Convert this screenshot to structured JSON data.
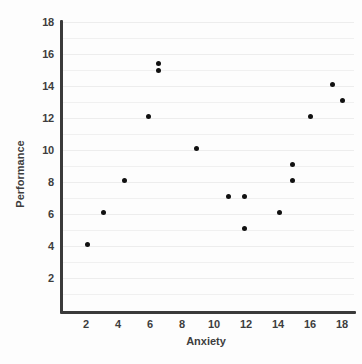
{
  "chart_data": {
    "type": "scatter",
    "title": "",
    "xlabel": "Anxiety",
    "ylabel": "Performance",
    "xlim": [
      0,
      19
    ],
    "ylim": [
      0,
      18
    ],
    "grid": true,
    "legend": null,
    "x_ticks": [
      2,
      4,
      6,
      8,
      10,
      12,
      14,
      16,
      18
    ],
    "y_ticks": [
      2,
      4,
      6,
      8,
      10,
      12,
      14,
      16,
      18
    ],
    "x_tick_labels": [
      "2",
      "4",
      "6",
      "8",
      "10",
      "12",
      "14",
      "16",
      "18"
    ],
    "y_tick_labels": [
      "2",
      "4",
      "6",
      "8",
      "10",
      "12",
      "14",
      "16",
      "18"
    ],
    "point_color": "#111111",
    "gridline_color": "#f0f0f0",
    "axis_color": "#3a3a3a",
    "series": [
      {
        "name": "observations",
        "points": [
          {
            "x": 2.1,
            "y": 4.1
          },
          {
            "x": 3.1,
            "y": 6.1
          },
          {
            "x": 4.4,
            "y": 8.1
          },
          {
            "x": 5.9,
            "y": 12.1
          },
          {
            "x": 6.5,
            "y": 15.4
          },
          {
            "x": 6.5,
            "y": 15.0
          },
          {
            "x": 8.9,
            "y": 10.1
          },
          {
            "x": 10.9,
            "y": 7.1
          },
          {
            "x": 11.9,
            "y": 7.1
          },
          {
            "x": 11.9,
            "y": 5.1
          },
          {
            "x": 14.1,
            "y": 6.1
          },
          {
            "x": 14.9,
            "y": 9.1
          },
          {
            "x": 14.9,
            "y": 8.1
          },
          {
            "x": 16.0,
            "y": 12.1
          },
          {
            "x": 17.4,
            "y": 14.1
          },
          {
            "x": 18.0,
            "y": 13.1
          }
        ]
      }
    ],
    "minor_gridlines_y": [
      1,
      2,
      3,
      4,
      5,
      6,
      7,
      8,
      9,
      10,
      11,
      12,
      13,
      14,
      15,
      16,
      17,
      18
    ]
  }
}
